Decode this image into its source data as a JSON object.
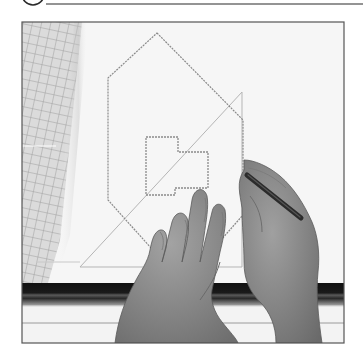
{
  "header": {
    "step_badge": {
      "shape": "circle",
      "cx": 33,
      "cy": -6,
      "r": 11,
      "stroke": "#2a2a2a",
      "step_number": ""
    },
    "rule": {
      "x1": 46,
      "y1": 4,
      "x2": 363,
      "y2": 4,
      "stroke": "#2a2a2a",
      "width": 1.2
    }
  },
  "figure": {
    "frame": {
      "x": 22,
      "y": 22,
      "width": 322,
      "height": 321,
      "stroke": "#555555"
    },
    "paper_color": "#f6f6f6",
    "grid_ruler": {
      "color": "#9a9a9a",
      "shade": "#c9c9c9"
    },
    "drawing": {
      "outline_stroke": "#8a8a8a",
      "octagon_points": "157,33 243,120 243,215 205,258 160,258 108,200 108,78",
      "floorplan_points": "146,137 178,137 178,152 208,152 208,188 175,188 175,195 146,195",
      "set_square_points": "80,267 242,92 242,267",
      "set_square_stroke": "#b5b5b5"
    },
    "ruler_band": {
      "y": 283,
      "height": 22,
      "color": "#151515",
      "highlight": "#6a6a6a",
      "base_line_y": 323
    },
    "pencil": {
      "x1": 247,
      "y1": 175,
      "x2": 301,
      "y2": 218,
      "color": "#2b2b2b"
    },
    "skin_tone": "#8c8c8c",
    "skin_shadow": "#6f6f6f"
  }
}
